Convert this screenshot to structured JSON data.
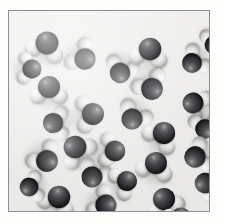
{
  "figure": {
    "kind": "space-filling-molecular-model",
    "caption": "",
    "description": "Space-filling model of liquid water: many H2O molecules",
    "background_color": "#f5f4f2",
    "page_color": "#fdfdfc",
    "border_color": "#8d8e90",
    "molecule_count": 28,
    "molecule_formula": "H2O",
    "atoms": {
      "oxygen": {
        "label": "O",
        "color": "#2e2f32",
        "radius_px": 11
      },
      "hydrogen": {
        "label": "H",
        "color": "#eeedea",
        "radius_px": 8
      }
    },
    "panel": {
      "x": 8,
      "y": 10,
      "width": 202,
      "height": 202
    }
  },
  "molecules": [
    {
      "id": "m01",
      "x": 38,
      "y": 32,
      "rot": 18,
      "scale": 1.04
    },
    {
      "id": "m02",
      "x": 76,
      "y": 48,
      "rot": 128,
      "scale": 0.97
    },
    {
      "id": "m03",
      "x": 111,
      "y": 62,
      "rot": 200,
      "scale": 0.93
    },
    {
      "id": "m04",
      "x": 141,
      "y": 38,
      "rot": 10,
      "scale": 1.02
    },
    {
      "id": "m05",
      "x": 183,
      "y": 52,
      "rot": 232,
      "scale": 0.9
    },
    {
      "id": "m06",
      "x": 40,
      "y": 76,
      "rot": 0,
      "scale": 1.0
    },
    {
      "id": "m07",
      "x": 143,
      "y": 78,
      "rot": 150,
      "scale": 0.99
    },
    {
      "id": "m08",
      "x": 184,
      "y": 92,
      "rot": 300,
      "scale": 0.95
    },
    {
      "id": "m09",
      "x": 84,
      "y": 103,
      "rot": 85,
      "scale": 1.0
    },
    {
      "id": "m10",
      "x": 123,
      "y": 108,
      "rot": 212,
      "scale": 0.96
    },
    {
      "id": "m11",
      "x": 44,
      "y": 112,
      "rot": 268,
      "scale": 0.92
    },
    {
      "id": "m12",
      "x": 155,
      "y": 122,
      "rot": 38,
      "scale": 1.01
    },
    {
      "id": "m13",
      "x": 196,
      "y": 118,
      "rot": 176,
      "scale": 0.88
    },
    {
      "id": "m14",
      "x": 66,
      "y": 136,
      "rot": 320,
      "scale": 1.03
    },
    {
      "id": "m15",
      "x": 106,
      "y": 140,
      "rot": 96,
      "scale": 0.94
    },
    {
      "id": "m16",
      "x": 186,
      "y": 146,
      "rot": 250,
      "scale": 0.97
    },
    {
      "id": "m17",
      "x": 38,
      "y": 150,
      "rot": 140,
      "scale": 0.99
    },
    {
      "id": "m18",
      "x": 147,
      "y": 152,
      "rot": 14,
      "scale": 1.0
    },
    {
      "id": "m19",
      "x": 83,
      "y": 166,
      "rot": 206,
      "scale": 0.95
    },
    {
      "id": "m20",
      "x": 118,
      "y": 170,
      "rot": 62,
      "scale": 0.91
    },
    {
      "id": "m21",
      "x": 196,
      "y": 172,
      "rot": 288,
      "scale": 0.93
    },
    {
      "id": "m22",
      "x": 50,
      "y": 186,
      "rot": 24,
      "scale": 1.02
    },
    {
      "id": "m23",
      "x": 97,
      "y": 194,
      "rot": 118,
      "scale": 0.96
    },
    {
      "id": "m24",
      "x": 155,
      "y": 188,
      "rot": 340,
      "scale": 1.0
    },
    {
      "id": "m25",
      "x": 23,
      "y": 58,
      "rot": 96,
      "scale": 0.86
    },
    {
      "id": "m26",
      "x": 205,
      "y": 34,
      "rot": 188,
      "scale": 0.84
    },
    {
      "id": "m27",
      "x": 20,
      "y": 176,
      "rot": 260,
      "scale": 0.85
    },
    {
      "id": "m28",
      "x": 172,
      "y": 206,
      "rot": 44,
      "scale": 0.87
    }
  ]
}
